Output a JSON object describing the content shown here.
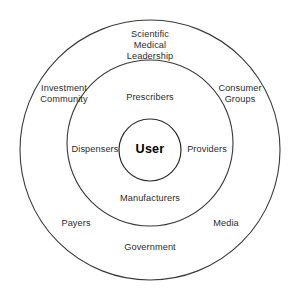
{
  "diagram": {
    "type": "concentric-circles",
    "background_color": "#ffffff",
    "stroke_color": "#3a3a3a",
    "text_color": "#2c2c2c",
    "center": {
      "label": "User",
      "circle": {
        "cx": 150,
        "cy": 150,
        "r": 31
      }
    },
    "rings": [
      {
        "name": "middle-ring",
        "circle": {
          "cx": 150,
          "cy": 143,
          "r": 83
        },
        "labels": [
          {
            "id": "prescribers",
            "text": "Prescribers",
            "x": 150,
            "y": 98
          },
          {
            "id": "dispensers",
            "text": "Dispensers",
            "x": 95,
            "y": 150
          },
          {
            "id": "providers",
            "text": "Providers",
            "x": 207,
            "y": 150
          },
          {
            "id": "manufacturers",
            "text": "Manufacturers",
            "x": 150,
            "y": 199
          }
        ]
      },
      {
        "name": "outer-ring",
        "circle": {
          "cx": 150,
          "cy": 150,
          "r": 130
        },
        "labels": [
          {
            "id": "scientific-medical-leadership",
            "text": "Scientific\nMedical\nLeadership",
            "x": 150,
            "y": 46
          },
          {
            "id": "investment-community",
            "text": "Investment\nCommunity",
            "x": 64,
            "y": 94
          },
          {
            "id": "consumer-groups",
            "text": "Consumer\nGroups",
            "x": 240,
            "y": 94
          },
          {
            "id": "payers",
            "text": "Payers",
            "x": 76,
            "y": 224
          },
          {
            "id": "media",
            "text": "Media",
            "x": 226,
            "y": 224
          },
          {
            "id": "government",
            "text": "Government",
            "x": 150,
            "y": 248
          }
        ]
      }
    ]
  }
}
